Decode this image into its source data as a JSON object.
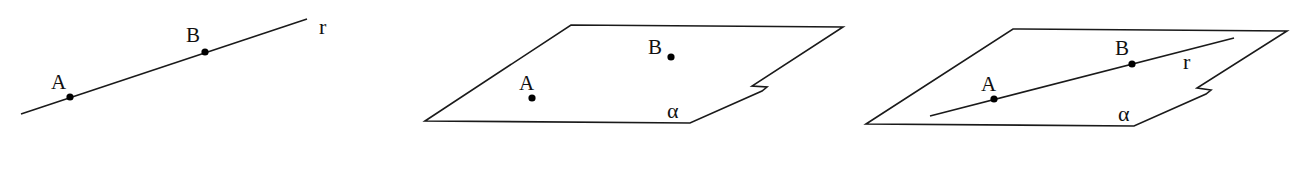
{
  "figure": {
    "panels": [
      {
        "id": "line-through-points",
        "description": "Line r through points A and B",
        "line": {
          "label": "r",
          "from": [
            21,
            114
          ],
          "to": [
            307,
            19
          ]
        },
        "points": [
          {
            "label": "A",
            "pos": [
              70,
              97
            ]
          },
          {
            "label": "B",
            "pos": [
              205,
              52
            ]
          }
        ]
      },
      {
        "id": "points-on-plane",
        "description": "Points A and B in plane alpha",
        "plane": {
          "label": "α"
        },
        "points": [
          {
            "label": "A",
            "pos": [
              532,
              98
            ]
          },
          {
            "label": "B",
            "pos": [
              671,
              57
            ]
          }
        ]
      },
      {
        "id": "line-in-plane",
        "description": "Line r through A and B contained in plane alpha",
        "plane": {
          "label": "α"
        },
        "line": {
          "label": "r",
          "from": [
            930,
            116
          ],
          "to": [
            1234,
            38
          ]
        },
        "points": [
          {
            "label": "A",
            "pos": [
              994,
              99
            ]
          },
          {
            "label": "B",
            "pos": [
              1132,
              64
            ]
          }
        ]
      }
    ],
    "colors": {
      "ink": "#1a1a1a",
      "background": "#ffffff"
    }
  }
}
